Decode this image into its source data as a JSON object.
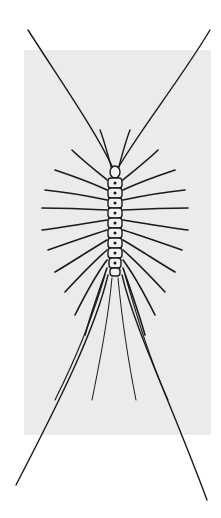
{
  "image": {
    "subject": "House centipede illustration",
    "description": "Black ink drawing of a house centipede viewed from above on a light grey rectangular panel, long antennae extending to the top corners and long rear legs extending to the bottom corners",
    "colors": {
      "background": "#ffffff",
      "panel": "#ebebeb",
      "ink": "#1a1a1a"
    }
  }
}
